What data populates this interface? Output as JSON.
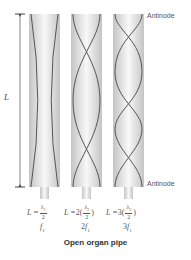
{
  "figure": {
    "caption": "Open organ pipe",
    "length_label": "L",
    "antinode_top_label": "Antinode",
    "antinode_bottom_label": "Antinode",
    "pipes": [
      {
        "harmonic": 1,
        "formula_prefix": "L = ",
        "formula_coef": "",
        "lambda": "λ",
        "lambda_sub": "1",
        "denominator": "2",
        "frequency": "f",
        "frequency_coef": "",
        "frequency_sub": "1"
      },
      {
        "harmonic": 2,
        "formula_prefix": "L = ",
        "formula_coef": "2(",
        "lambda": "λ",
        "lambda_sub": "2",
        "denominator": "2",
        "frequency": "f",
        "frequency_coef": "2",
        "frequency_sub": "1"
      },
      {
        "harmonic": 3,
        "formula_prefix": "L = ",
        "formula_coef": "3(",
        "lambda": "λ",
        "lambda_sub": "3",
        "denominator": "2",
        "frequency": "f",
        "frequency_coef": "3",
        "frequency_sub": "1"
      }
    ],
    "colors": {
      "pipe_edge": "#c8c8c8",
      "pipe_center": "#f7f7f7",
      "wave": "#555555",
      "text": "#555555"
    }
  }
}
